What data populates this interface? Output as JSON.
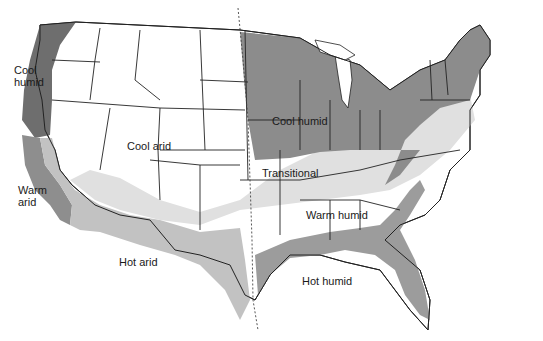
{
  "map": {
    "title": "US climate zones",
    "colors": {
      "cool_humid": "#8c8c8c",
      "cool_humid_west": "#707070",
      "warm_arid": "#9a9a9a",
      "hot_arid": "#c4c4c4",
      "transitional": "#e2e2e2",
      "warm_humid": "#ffffff",
      "hot_humid": "#9e9e9e",
      "cool_arid": "#ffffff",
      "outline": "#222222"
    },
    "zones": [
      {
        "id": "cool-humid-west",
        "label": "Cool\nhumid"
      },
      {
        "id": "cool-arid",
        "label": "Cool arid"
      },
      {
        "id": "cool-humid-east",
        "label": "Cool humid"
      },
      {
        "id": "warm-arid",
        "label": "Warm\narid"
      },
      {
        "id": "transitional",
        "label": "Transitional"
      },
      {
        "id": "warm-humid",
        "label": "Warm humid"
      },
      {
        "id": "hot-arid",
        "label": "Hot arid"
      },
      {
        "id": "hot-humid",
        "label": "Hot humid"
      }
    ]
  }
}
